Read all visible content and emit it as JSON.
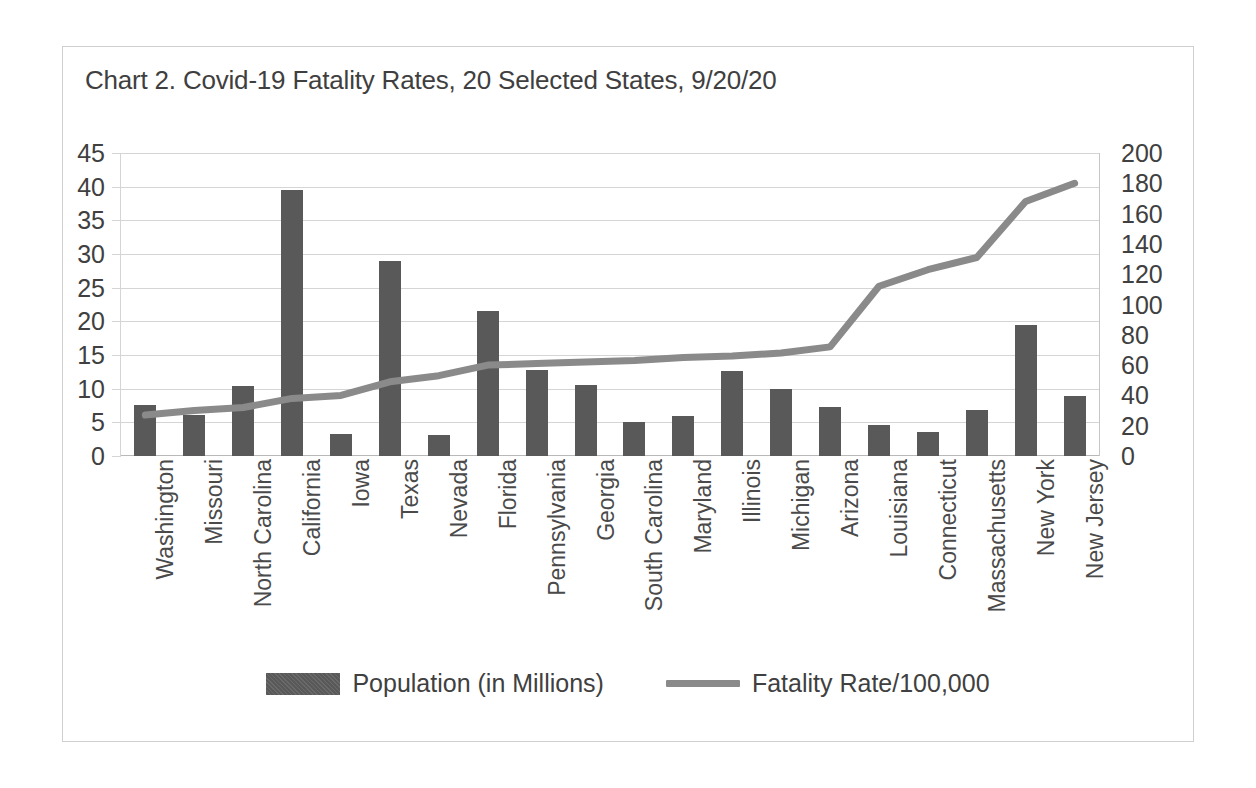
{
  "chart_data": {
    "type": "bar",
    "title": "Chart 2. Covid-19 Fatality Rates, 20 Selected States, 9/20/20",
    "xlabel": "",
    "ylabel": "",
    "grid": true,
    "legend_position": "bottom",
    "categories": [
      "Washington",
      "Missouri",
      "North Carolina",
      "California",
      "Iowa",
      "Texas",
      "Nevada",
      "Florida",
      "Pennsylvania",
      "Georgia",
      "South Carolina",
      "Maryland",
      "Illinois",
      "Michigan",
      "Arizona",
      "Louisiana",
      "Connecticut",
      "Massachusetts",
      "New York",
      "New Jersey"
    ],
    "series": [
      {
        "name": "Population (in Millions)",
        "type": "bar",
        "axis": "left",
        "color": "#595959",
        "values": [
          7.6,
          6.1,
          10.4,
          39.5,
          3.2,
          29.0,
          3.1,
          21.5,
          12.8,
          10.6,
          5.1,
          6.0,
          12.7,
          10.0,
          7.3,
          4.6,
          3.6,
          6.9,
          19.5,
          8.9
        ]
      },
      {
        "name": "Fatality Rate/100,000",
        "type": "line",
        "axis": "right",
        "color": "#8a8a8a",
        "values": [
          27,
          30,
          32,
          38,
          40,
          49,
          53,
          60,
          61,
          62,
          63,
          65,
          66,
          68,
          72,
          112,
          123,
          131,
          168,
          180
        ]
      }
    ],
    "axes": {
      "left": {
        "min": 0,
        "max": 45,
        "step": 5,
        "ticks": [
          "45",
          "40",
          "35",
          "30",
          "25",
          "20",
          "15",
          "10",
          "5",
          "0"
        ]
      },
      "right": {
        "min": 0,
        "max": 200,
        "step": 20,
        "ticks": [
          "200",
          "180",
          "160",
          "140",
          "120",
          "100",
          "80",
          "60",
          "40",
          "20",
          "0"
        ]
      }
    },
    "legend": [
      {
        "label": "Population (in Millions)",
        "swatch": "bar-swatch",
        "color": "#595959"
      },
      {
        "label": "Fatality Rate/100,000",
        "swatch": "line-swatch",
        "color": "#8a8a8a"
      }
    ],
    "colors": {
      "bar": "#595959",
      "line": "#8a8a8a",
      "gridline": "#d5d5d5",
      "text": "#404040",
      "frame": "#cfcfcf",
      "background": "#ffffff"
    }
  }
}
